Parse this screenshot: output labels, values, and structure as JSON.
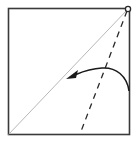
{
  "diagram": {
    "type": "origami-fold-instruction",
    "colors": {
      "paper_edge": "#3a3a3a",
      "crease": "#b8b8b8",
      "fold_line": "#2a2a2a",
      "arrow": "#1a1a1a",
      "pivot_marker": "#2a2a2a",
      "background": "#ffffff"
    },
    "elements": {
      "square": {
        "x": 8,
        "y": 8,
        "width": 121,
        "height": 126
      },
      "diagonal_crease": {
        "x1": 8,
        "y1": 134,
        "x2": 128,
        "y2": 9
      },
      "valley_fold_line": {
        "x1": 127,
        "y1": 11,
        "x2": 80,
        "y2": 134,
        "style": "dashed"
      },
      "fold_arrow": {
        "start": [
          129,
          90
        ],
        "end": [
          68,
          77
        ]
      },
      "pivot_point": {
        "cx": 128,
        "cy": 9,
        "r": 2.5
      }
    }
  }
}
